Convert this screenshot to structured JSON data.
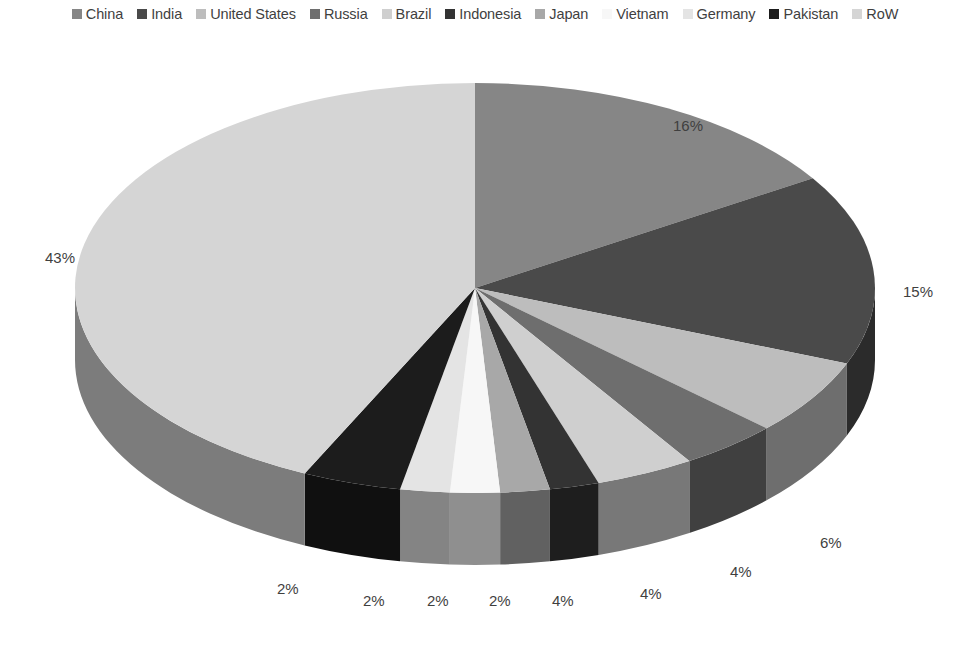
{
  "legend": {
    "items": [
      {
        "label": "China",
        "color": "#868686"
      },
      {
        "label": "India",
        "color": "#4a4a4a"
      },
      {
        "label": "United States",
        "color": "#bdbdbd"
      },
      {
        "label": "Russia",
        "color": "#6e6e6e"
      },
      {
        "label": "Brazil",
        "color": "#cfcfcf"
      },
      {
        "label": "Indonesia",
        "color": "#333333"
      },
      {
        "label": "Japan",
        "color": "#a8a8a8"
      },
      {
        "label": "Vietnam",
        "color": "#f7f7f7"
      },
      {
        "label": "Germany",
        "color": "#e4e4e4"
      },
      {
        "label": "Pakistan",
        "color": "#1c1c1c"
      },
      {
        "label": "RoW",
        "color": "#d5d5d5"
      }
    ]
  },
  "chart_data": {
    "type": "pie",
    "title": "",
    "three_d": true,
    "start_angle_deg": -90,
    "direction": "clockwise",
    "categories": [
      "China",
      "India",
      "United States",
      "Russia",
      "Brazil",
      "Indonesia",
      "Japan",
      "Vietnam",
      "Germany",
      "Pakistan",
      "RoW"
    ],
    "values": [
      16,
      15,
      6,
      4,
      4,
      2,
      2,
      2,
      2,
      4,
      43
    ],
    "colors": [
      "#868686",
      "#4a4a4a",
      "#bdbdbd",
      "#6e6e6e",
      "#cfcfcf",
      "#333333",
      "#a8a8a8",
      "#f7f7f7",
      "#e4e4e4",
      "#1c1c1c",
      "#d5d5d5"
    ],
    "unit": "%",
    "legend_position": "top",
    "data_labels": [
      {
        "text": "16%",
        "x": 673,
        "y": 92
      },
      {
        "text": "15%",
        "x": 903,
        "y": 258
      },
      {
        "text": "6%",
        "x": 820,
        "y": 509
      },
      {
        "text": "4%",
        "x": 730,
        "y": 538
      },
      {
        "text": "4%",
        "x": 640,
        "y": 560
      },
      {
        "text": "4%",
        "x": 552,
        "y": 567
      },
      {
        "text": "2%",
        "x": 489,
        "y": 567
      },
      {
        "text": "2%",
        "x": 427,
        "y": 567
      },
      {
        "text": "2%",
        "x": 363,
        "y": 567
      },
      {
        "text": "2%",
        "x": 277,
        "y": 555
      },
      {
        "text": "43%",
        "x": 45,
        "y": 224
      }
    ]
  }
}
